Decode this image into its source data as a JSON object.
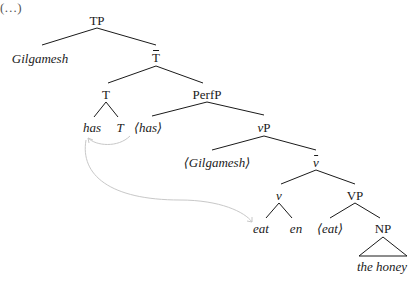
{
  "diagram": {
    "type": "syntax-tree",
    "partial_label_top_left": "(…)",
    "nodes": {
      "TP": "TP",
      "spec_TP": "Gilgamesh",
      "T_bar": "T",
      "T": "T",
      "T_has": "has",
      "T_T": "T",
      "PerfP": "PerfP",
      "has_trace": "⟨has⟩",
      "vP": "vP",
      "vP_v": "v",
      "vP_P": "P",
      "gilgamesh_trace": "⟨Gilgamesh⟩",
      "v_bar": "v",
      "v": "v",
      "v_eat": "eat",
      "v_en": "en",
      "VP": "VP",
      "eat_trace": "⟨eat⟩",
      "NP": "NP",
      "NP_text": "the honey"
    },
    "arrows": [
      {
        "from": "⟨has⟩",
        "to": "has"
      },
      {
        "from": "has",
        "to": "eat"
      }
    ],
    "colors": {
      "lines": "#1a1a1a",
      "arrows": "#c8c8c8"
    }
  }
}
